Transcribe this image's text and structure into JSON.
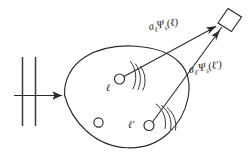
{
  "figure": {
    "background_color": "#ffffff",
    "ink_color": "#2b2b2b",
    "width": 250,
    "height": 159
  },
  "labels": {
    "amplitude_1": {
      "full_text": "aℓΨs(ℓ)",
      "coefficient": "a",
      "coefficient_subscript": "ℓ",
      "field_symbol": "Ψ",
      "field_subscript": "s",
      "argument": "(ℓ)"
    },
    "amplitude_2": {
      "full_text": "aℓ′Ψs(ℓ′)",
      "coefficient": "a",
      "coefficient_subscript": "ℓ′",
      "field_symbol": "Ψ",
      "field_subscript": "s",
      "argument": "(ℓ′)"
    },
    "site_1": "ℓ",
    "site_2": "ℓ′"
  },
  "elements": {
    "grating_name": "incident-grating",
    "medium_name": "scattering-medium-blob",
    "detector_name": "detector",
    "incident_arrow_name": "incident-wave-arrow",
    "scatterer_1_name": "scatterer-ell",
    "scatterer_2_name": "scatterer-ell-prime",
    "scatterer_3_name": "scatterer-unlabeled",
    "wave_arcs_1_name": "radiated-wave-arcs-ell",
    "wave_arcs_2_name": "radiated-wave-arcs-ell-prime"
  }
}
